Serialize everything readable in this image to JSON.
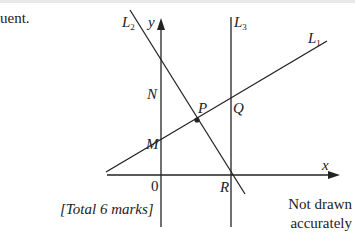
{
  "text": {
    "fragment": "uent.",
    "total_marks": "[Total 6 marks]",
    "note_line1": "Not drawn",
    "note_line2": "accurately"
  },
  "diagram": {
    "axes": {
      "x_label": "x",
      "y_label": "y",
      "origin_label": "0"
    },
    "lines": [
      {
        "name": "L",
        "sub": "1"
      },
      {
        "name": "L",
        "sub": "2"
      },
      {
        "name": "L",
        "sub": "3"
      }
    ],
    "points": {
      "N": "N",
      "M": "M",
      "P": "P",
      "Q": "Q",
      "R": "R"
    },
    "colors": {
      "ink": "#222222",
      "background": "#ffffff"
    }
  }
}
